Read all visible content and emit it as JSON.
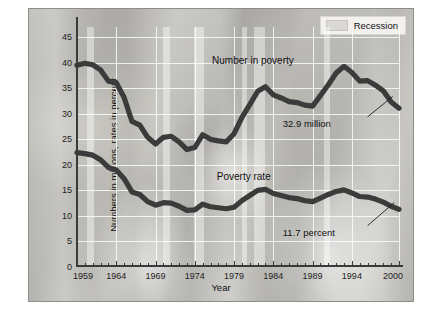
{
  "chart_data": {
    "type": "line",
    "title": "",
    "xlabel": "Year",
    "ylabel": "Numbers in millions, rates in percent",
    "xlim": [
      1959,
      2000
    ],
    "ylim": [
      0,
      47
    ],
    "grid": true,
    "y_ticks": [
      0,
      5,
      10,
      15,
      20,
      25,
      30,
      35,
      40,
      45
    ],
    "x_ticks_major": [
      1959,
      1964,
      1969,
      1974,
      1979,
      1984,
      1989,
      1994,
      2000
    ],
    "x_tick_step_minor": 1,
    "legend": {
      "position": "top-right",
      "entries": [
        "Recession"
      ]
    },
    "x": [
      1959,
      1960,
      1961,
      1962,
      1963,
      1964,
      1965,
      1966,
      1967,
      1968,
      1969,
      1970,
      1971,
      1972,
      1973,
      1974,
      1975,
      1976,
      1977,
      1978,
      1979,
      1980,
      1981,
      1982,
      1983,
      1984,
      1985,
      1986,
      1987,
      1988,
      1989,
      1990,
      1991,
      1992,
      1993,
      1994,
      1995,
      1996,
      1997,
      1998,
      1999,
      2000
    ],
    "series": [
      {
        "name": "Number in poverty",
        "unit": "millions",
        "label_position": "above-line",
        "end_annotation": "32.9 million",
        "values": [
          39.5,
          39.9,
          39.6,
          38.6,
          36.4,
          36.1,
          33.2,
          28.5,
          27.8,
          25.4,
          24.1,
          25.4,
          25.6,
          24.5,
          23.0,
          23.4,
          25.9,
          25.0,
          24.7,
          24.5,
          26.1,
          29.3,
          31.8,
          34.4,
          35.3,
          33.7,
          33.1,
          32.4,
          32.2,
          31.7,
          31.5,
          33.6,
          35.7,
          38.0,
          39.3,
          38.1,
          36.4,
          36.5,
          35.6,
          34.5,
          32.3,
          31.1
        ]
      },
      {
        "name": "Poverty rate",
        "unit": "percent",
        "label_position": "above-line",
        "end_annotation": "11.7 percent",
        "values": [
          22.4,
          22.2,
          21.9,
          21.0,
          19.5,
          19.0,
          17.3,
          14.7,
          14.2,
          12.8,
          12.1,
          12.6,
          12.5,
          11.9,
          11.1,
          11.2,
          12.3,
          11.8,
          11.6,
          11.4,
          11.7,
          13.0,
          14.0,
          15.0,
          15.2,
          14.4,
          14.0,
          13.6,
          13.4,
          13.0,
          12.8,
          13.5,
          14.2,
          14.8,
          15.1,
          14.5,
          13.8,
          13.7,
          13.3,
          12.7,
          11.9,
          11.3
        ]
      }
    ],
    "recessions": [
      {
        "start": 1960.3,
        "end": 1961.2
      },
      {
        "start": 1969.9,
        "end": 1970.9
      },
      {
        "start": 1973.9,
        "end": 1975.2
      },
      {
        "start": 1980.0,
        "end": 1980.6
      },
      {
        "start": 1981.5,
        "end": 1982.9
      },
      {
        "start": 1990.5,
        "end": 1991.2
      }
    ],
    "colors": {
      "line": "#3b3b3b",
      "grid": "#ffffff",
      "axis": "#3a3a3a",
      "recession_band": "#ffffff",
      "legend_swatch": "#d9d8d4"
    }
  }
}
